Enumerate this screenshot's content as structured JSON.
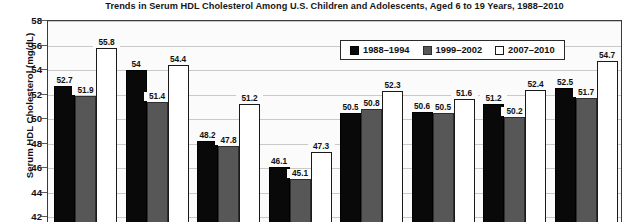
{
  "chart_data": {
    "type": "bar",
    "title": "Trends in Serum HDL Cholesterol Among U.S. Children and Adolescents, Aged 6 to 19 Years, 1988–2010",
    "xlabel": "",
    "ylabel": "Serum HDL Cholesterol (mg/dL)",
    "ylim": [
      42,
      58
    ],
    "ytick_step": 2,
    "yticks": [
      58,
      56,
      54,
      52,
      50,
      48,
      46,
      44,
      42
    ],
    "grid": true,
    "legend_position": "top-right-inside",
    "categories": [
      "",
      "",
      "",
      "",
      "",
      "",
      "",
      ""
    ],
    "series": [
      {
        "name": "1988–1994",
        "color": "#090909",
        "values": [
          52.7,
          54,
          48.2,
          46.1,
          50.5,
          50.6,
          51.2,
          52.5
        ],
        "labels": [
          "52.7",
          "54",
          "48.2",
          "46.1",
          "50.5",
          "50.6",
          "51.2",
          "52.5"
        ]
      },
      {
        "name": "1999–2002",
        "color": "#575757",
        "values": [
          51.9,
          51.4,
          47.8,
          45.1,
          50.8,
          50.5,
          50.2,
          51.7
        ],
        "labels": [
          "51.9",
          "51.4",
          "47.8",
          "45.1",
          "50.8",
          "50.5",
          "50.2",
          "51.7"
        ]
      },
      {
        "name": "2007–2010",
        "color": "#ffffff",
        "values": [
          55.8,
          54.4,
          51.2,
          47.3,
          52.3,
          51.6,
          52.4,
          54.7
        ],
        "labels": [
          "55.8",
          "54.4",
          "51.2",
          "47.3",
          "52.3",
          "51.6",
          "52.4",
          "54.7"
        ]
      }
    ]
  },
  "legend": {
    "items": [
      {
        "label": "1988–1994",
        "swatch": "black-square-icon"
      },
      {
        "label": "1999–2002",
        "swatch": "gray-square-icon"
      },
      {
        "label": "2007–2010",
        "swatch": "white-square-icon"
      }
    ]
  }
}
